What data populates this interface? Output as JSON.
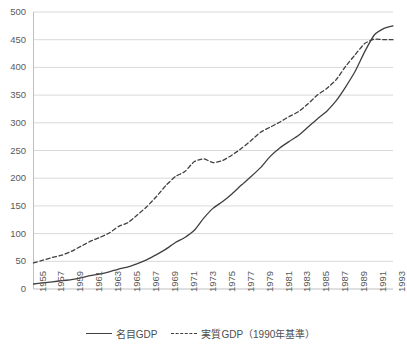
{
  "chart_data": {
    "type": "line",
    "title": "",
    "xlabel": "",
    "ylabel": "",
    "ylim": [
      0,
      500
    ],
    "ytick_step": 50,
    "yticks": [
      "500",
      "450",
      "400",
      "350",
      "300",
      "250",
      "200",
      "150",
      "100",
      "50",
      "0"
    ],
    "grid": true,
    "legend_position": "bottom",
    "x": [
      1955,
      1956,
      1957,
      1958,
      1959,
      1960,
      1961,
      1962,
      1963,
      1964,
      1965,
      1966,
      1967,
      1968,
      1969,
      1970,
      1971,
      1972,
      1973,
      1974,
      1975,
      1976,
      1977,
      1978,
      1979,
      1980,
      1981,
      1982,
      1983,
      1984,
      1985,
      1986,
      1987,
      1988,
      1989,
      1990,
      1991,
      1992,
      1993
    ],
    "xtick_labels": [
      "1955",
      "1957",
      "1959",
      "1961",
      "1963",
      "1965",
      "1967",
      "1969",
      "1971",
      "1973",
      "1975",
      "1977",
      "1979",
      "1981",
      "1983",
      "1985",
      "1987",
      "1989",
      "1991",
      "1993"
    ],
    "series": [
      {
        "name": "名目GDP",
        "style": "solid",
        "color": "#404040",
        "values": [
          9,
          11,
          13,
          15,
          17,
          20,
          24,
          27,
          31,
          36,
          40,
          46,
          53,
          62,
          72,
          84,
          93,
          106,
          128,
          146,
          158,
          172,
          188,
          203,
          219,
          239,
          254,
          266,
          277,
          292,
          307,
          321,
          340,
          365,
          393,
          428,
          458,
          470,
          475
        ]
      },
      {
        "name": "実質GDP（1990年基準）",
        "style": "dashed",
        "color": "#404040",
        "values": [
          47,
          52,
          57,
          61,
          68,
          77,
          86,
          93,
          101,
          113,
          120,
          134,
          149,
          167,
          187,
          203,
          212,
          230,
          235,
          228,
          232,
          242,
          254,
          268,
          283,
          292,
          301,
          311,
          320,
          334,
          350,
          362,
          378,
          402,
          423,
          443,
          451,
          450,
          450
        ]
      }
    ]
  },
  "legend": {
    "entries": [
      {
        "label": "名目GDP",
        "style": "solid"
      },
      {
        "label": "実質GDP（1990年基準）",
        "style": "dashed"
      }
    ]
  }
}
